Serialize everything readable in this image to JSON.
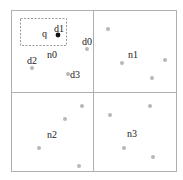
{
  "diagram": {
    "type": "quadtree-partition",
    "outer_box": {
      "x": 11,
      "y": 10,
      "w": 165,
      "h": 161
    },
    "divider": {
      "x": 93,
      "y": 92
    },
    "query": {
      "label": "q",
      "label_pos": [
        42,
        37
      ],
      "box": {
        "x": 20,
        "y": 18,
        "w": 46,
        "h": 27
      }
    },
    "colors": {
      "border": "#b0b0b0",
      "point": "#b8b8b8",
      "highlight_point": "#111111",
      "text": "#222222",
      "dashed": "#999999"
    },
    "nodes": [
      {
        "label": "n0",
        "label_pos": [
          47,
          58
        ]
      },
      {
        "label": "n1",
        "label_pos": [
          128,
          58
        ]
      },
      {
        "label": "n2",
        "label_pos": [
          47,
          138
        ]
      },
      {
        "label": "n3",
        "label_pos": [
          127,
          137
        ]
      }
    ],
    "labeled_points": [
      {
        "label": "d0",
        "x": 87,
        "y": 49,
        "label_pos": [
          82,
          45
        ],
        "highlight": false
      },
      {
        "label": "d1",
        "x": 58,
        "y": 35,
        "label_pos": [
          54,
          32
        ],
        "highlight": true
      },
      {
        "label": "d2",
        "x": 32,
        "y": 68,
        "label_pos": [
          27,
          64
        ],
        "highlight": false
      },
      {
        "label": "d3",
        "x": 68,
        "y": 74,
        "label_pos": [
          70,
          78
        ],
        "highlight": false
      }
    ],
    "points": [
      {
        "node": "n1",
        "x": 108,
        "y": 29
      },
      {
        "node": "n1",
        "x": 122,
        "y": 63
      },
      {
        "node": "n1",
        "x": 165,
        "y": 60
      },
      {
        "node": "n1",
        "x": 152,
        "y": 78
      },
      {
        "node": "n2",
        "x": 82,
        "y": 106
      },
      {
        "node": "n2",
        "x": 65,
        "y": 119
      },
      {
        "node": "n2",
        "x": 39,
        "y": 148
      },
      {
        "node": "n2",
        "x": 79,
        "y": 166
      },
      {
        "node": "n3",
        "x": 150,
        "y": 106
      },
      {
        "node": "n3",
        "x": 110,
        "y": 115
      },
      {
        "node": "n3",
        "x": 124,
        "y": 148
      },
      {
        "node": "n3",
        "x": 153,
        "y": 157
      }
    ]
  }
}
